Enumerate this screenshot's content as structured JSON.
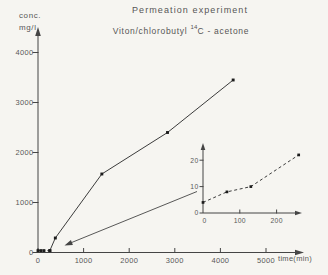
{
  "header": {
    "title": "Permeation experiment",
    "subtitle_prefix": "Viton/chlorobutyl ",
    "subtitle_superscript": "14",
    "subtitle_suffix": "C - acetone"
  },
  "main_chart": {
    "y_axis_label_line1": "conc.",
    "y_axis_label_line2": "mg/l",
    "x_axis_label": "time(min)"
  },
  "colors": {
    "background": "#f6f5f1",
    "axis": "#454545",
    "line": "#3c3c3c",
    "marker": "#1c1c1c",
    "text": "#585858"
  },
  "chart_data": [
    {
      "type": "line",
      "title": "Permeation experiment",
      "subtitle": "Viton/chlorobutyl 14C - acetone",
      "xlabel": "time(min)",
      "ylabel": "conc. mg/l",
      "xlim": [
        0,
        5830
      ],
      "ylim": [
        0,
        4390
      ],
      "x_ticks": [
        0,
        1000,
        2000,
        3000,
        4000,
        5000
      ],
      "y_ticks": [
        0,
        1000,
        2000,
        3000,
        4000
      ],
      "grid": false,
      "legend": "none",
      "series": [
        {
          "name": "early permeation (near zero, dashed)",
          "style": "dashed",
          "marker": "square",
          "points": [
            [
              0,
              4
            ],
            [
              65,
              8
            ],
            [
              130,
              10
            ],
            [
              260,
              22
            ]
          ]
        },
        {
          "name": "permeation concentration (solid)",
          "style": "solid",
          "marker": "square",
          "points": [
            [
              260,
              22
            ],
            [
              380,
              290
            ],
            [
              1400,
              1570
            ],
            [
              2840,
              2400
            ],
            [
              4280,
              3450
            ]
          ]
        }
      ],
      "annotation": "arrow from inset magnified view pointing to early-time data near origin"
    },
    {
      "type": "line",
      "role": "inset-zoom-of-early-region",
      "xlim": [
        0,
        269
      ],
      "ylim": [
        0,
        26
      ],
      "x_ticks": [
        0,
        100,
        200
      ],
      "y_ticks": [
        0,
        10,
        20
      ],
      "grid": false,
      "series": [
        {
          "name": "early permeation zoom",
          "style": "dashed",
          "marker": "square",
          "points": [
            [
              0,
              4
            ],
            [
              65,
              8
            ],
            [
              130,
              10
            ],
            [
              260,
              22
            ]
          ]
        }
      ]
    }
  ]
}
